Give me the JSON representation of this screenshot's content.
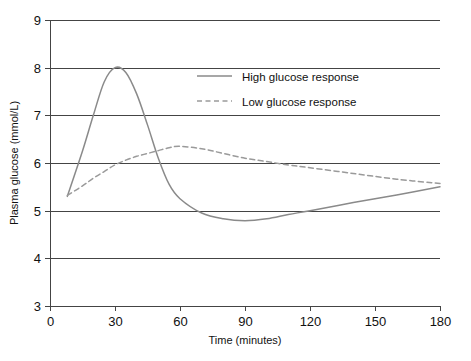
{
  "chart_data": {
    "type": "line",
    "title": "",
    "xlabel": "Time (minutes)",
    "ylabel": "Plasma glucose (mmol/L)",
    "xlim": [
      0,
      180
    ],
    "ylim": [
      3,
      9
    ],
    "xticks": [
      "0",
      "30",
      "60",
      "90",
      "120",
      "150",
      "180"
    ],
    "xtick_values": [
      0,
      30,
      60,
      90,
      120,
      150,
      180
    ],
    "yticks": [
      "3",
      "4",
      "5",
      "6",
      "7",
      "8",
      "9"
    ],
    "ytick_values": [
      3,
      4,
      5,
      6,
      7,
      8,
      9
    ],
    "grid": "horizontal",
    "legend_position": "upper-center",
    "x": [
      8,
      15,
      20,
      25,
      30,
      35,
      40,
      45,
      50,
      55,
      60,
      70,
      80,
      90,
      100,
      110,
      120,
      140,
      160,
      180
    ],
    "series": [
      {
        "name": "High glucose response",
        "style": "solid",
        "color": "#8a8a8a",
        "values": [
          5.3,
          6.25,
          7.0,
          7.7,
          8.0,
          7.9,
          7.45,
          6.8,
          6.1,
          5.55,
          5.25,
          4.95,
          4.83,
          4.79,
          4.83,
          4.92,
          5.0,
          5.17,
          5.33,
          5.5
        ]
      },
      {
        "name": "Low glucose response",
        "style": "dashed",
        "color": "#9a9a9a",
        "values": [
          5.32,
          5.52,
          5.68,
          5.82,
          5.96,
          6.06,
          6.14,
          6.2,
          6.26,
          6.32,
          6.35,
          6.3,
          6.2,
          6.1,
          6.03,
          5.96,
          5.9,
          5.78,
          5.66,
          5.57
        ]
      }
    ],
    "legend": [
      {
        "label": "High glucose response",
        "style": "solid",
        "color": "#8a8a8a"
      },
      {
        "label": "Low glucose response",
        "style": "dashed",
        "color": "#9a9a9a"
      }
    ],
    "colors": {
      "axis": "#444444",
      "grid": "#444444",
      "text": "#111111",
      "background": "#ffffff"
    }
  }
}
